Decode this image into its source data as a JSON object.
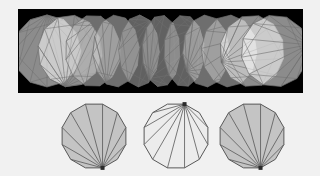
{
  "figure": {
    "background_color": "#f1f1f1",
    "width": 320,
    "height": 176
  },
  "panel": {
    "name": "morph-sequence-panel",
    "background_color": "#000000",
    "x": 18,
    "y": 9,
    "width": 285,
    "height": 84,
    "border_color": "#000000"
  },
  "style": {
    "polygon_fill_white": "#ffffff",
    "polygon_fill_light": "#ececec",
    "polygon_fill_mid": "#c9c9c9",
    "polygon_fill_dark": "#b0b0b0",
    "edge_color": "#6f6f6f",
    "edge_color_dark": "#585858",
    "apex_marker_color": "#2b2b2b",
    "fill_opacity": "0.55",
    "edge_width": "0.7"
  },
  "sequence": {
    "name": "overlapping-polygon-sequence",
    "count": 11,
    "center_y": 51,
    "start_x": 47,
    "end_x": 275,
    "radius_x": 34,
    "radius_y": 36,
    "sides": 12,
    "description": "Sequence of overlapping triangulated convex polygons interpolating left to right",
    "steps": [
      {
        "index": 0,
        "cx": 47,
        "shade": "white",
        "squeeze": 1.0,
        "rotation": 0
      },
      {
        "index": 1,
        "cx": 70,
        "shade": "white",
        "squeeze": 0.92,
        "rotation": 8
      },
      {
        "index": 2,
        "cx": 93,
        "shade": "mid",
        "squeeze": 0.72,
        "rotation": 16
      },
      {
        "index": 3,
        "cx": 116,
        "shade": "mid",
        "squeeze": 0.52,
        "rotation": 24
      },
      {
        "index": 4,
        "cx": 139,
        "shade": "dark",
        "squeeze": 0.38,
        "rotation": 32
      },
      {
        "index": 5,
        "cx": 161,
        "shade": "dark",
        "squeeze": 0.32,
        "rotation": 40
      },
      {
        "index": 6,
        "cx": 184,
        "shade": "dark",
        "squeeze": 0.38,
        "rotation": 48
      },
      {
        "index": 7,
        "cx": 206,
        "shade": "mid",
        "squeeze": 0.52,
        "rotation": 56
      },
      {
        "index": 8,
        "cx": 229,
        "shade": "mid",
        "squeeze": 0.72,
        "rotation": 64
      },
      {
        "index": 9,
        "cx": 252,
        "shade": "white",
        "squeeze": 0.92,
        "rotation": 72
      },
      {
        "index": 10,
        "cx": 275,
        "shade": "white",
        "squeeze": 1.0,
        "rotation": 80
      }
    ]
  },
  "polygons": {
    "name": "triangulated-polygon-row",
    "count": 3,
    "sides": 12,
    "center_y": 136,
    "radius": 33,
    "items": [
      {
        "index": 0,
        "name": "polygon-left",
        "label": "",
        "cx": 94,
        "cy": 136,
        "fill": "#c4c4c4",
        "fan_apex": "bottom",
        "apex_marker": true,
        "triangulation": "fan"
      },
      {
        "index": 1,
        "name": "polygon-middle",
        "label": "",
        "cx": 176,
        "cy": 136,
        "fill": "#ececec",
        "fan_apex": "top",
        "apex_marker": true,
        "triangulation": "fan"
      },
      {
        "index": 2,
        "name": "polygon-right",
        "label": "",
        "cx": 252,
        "cy": 136,
        "fill": "#c4c4c4",
        "fan_apex": "bottom",
        "apex_marker": true,
        "triangulation": "fan"
      }
    ]
  }
}
